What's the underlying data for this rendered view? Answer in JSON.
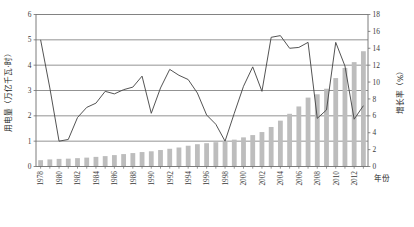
{
  "chart_data": {
    "type": "bar",
    "title": "",
    "subtitle": "",
    "xlabel": "年份",
    "ylabel": "用电量（万亿千瓦·时）",
    "y2label": "增长率（%）",
    "ylim": [
      0,
      6
    ],
    "y2lim": [
      0,
      18
    ],
    "yticks": [
      "0",
      "1",
      "2",
      "3",
      "4",
      "5",
      "6"
    ],
    "y2ticks": [
      "0",
      "2",
      "4",
      "6",
      "8",
      "10",
      "12",
      "14",
      "16",
      "18"
    ],
    "grid": "horizontal",
    "legend_position": "none",
    "x": [
      1978,
      1979,
      1980,
      1981,
      1982,
      1983,
      1984,
      1985,
      1986,
      1987,
      1988,
      1989,
      1990,
      1991,
      1992,
      1993,
      1994,
      1995,
      1996,
      1997,
      1998,
      1999,
      2000,
      2001,
      2002,
      2003,
      2004,
      2005,
      2006,
      2007,
      2008,
      2009,
      2010,
      2011,
      2012,
      2013
    ],
    "xtick_labels": [
      "1978",
      "1980",
      "1982",
      "1984",
      "1986",
      "1988",
      "1990",
      "1992",
      "1994",
      "1996",
      "1998",
      "2000",
      "2002",
      "2004",
      "2006",
      "2008",
      "2010",
      "2012"
    ],
    "series": [
      {
        "name": "用电量",
        "type": "bar",
        "axis": "left",
        "unit": "万亿千瓦·时",
        "color": "#bdbdbd",
        "values": [
          0.25,
          0.28,
          0.3,
          0.31,
          0.33,
          0.35,
          0.38,
          0.41,
          0.45,
          0.49,
          0.53,
          0.57,
          0.6,
          0.65,
          0.7,
          0.75,
          0.82,
          0.88,
          0.92,
          0.96,
          1.0,
          1.06,
          1.15,
          1.24,
          1.36,
          1.56,
          1.81,
          2.08,
          2.37,
          2.72,
          2.85,
          3.07,
          3.49,
          3.89,
          4.12,
          4.55
        ]
      },
      {
        "name": "增长率",
        "type": "line",
        "axis": "right",
        "unit": "%",
        "color": "#4a4a4a",
        "values": [
          15.0,
          9.3,
          3.0,
          3.2,
          5.8,
          7.0,
          7.5,
          8.9,
          8.6,
          9.1,
          9.4,
          10.7,
          6.3,
          9.3,
          11.5,
          10.8,
          10.3,
          8.7,
          6.1,
          5.0,
          3.0,
          6.3,
          9.5,
          11.8,
          8.9,
          15.3,
          15.5,
          14.0,
          14.1,
          14.7,
          5.7,
          6.7,
          14.7,
          11.9,
          5.6,
          7.2
        ]
      }
    ],
    "annotations": []
  },
  "axis": {
    "left_title": "用电量（万亿千瓦·时）",
    "right_title": "增长率（%）",
    "x_title": "年份"
  },
  "caption": {
    "text": ""
  },
  "colors": {
    "bar": "#bdbdbd",
    "line": "#4a4a4a",
    "grid": "#808080",
    "axis": "#6e6e6e",
    "text": "#333333"
  }
}
